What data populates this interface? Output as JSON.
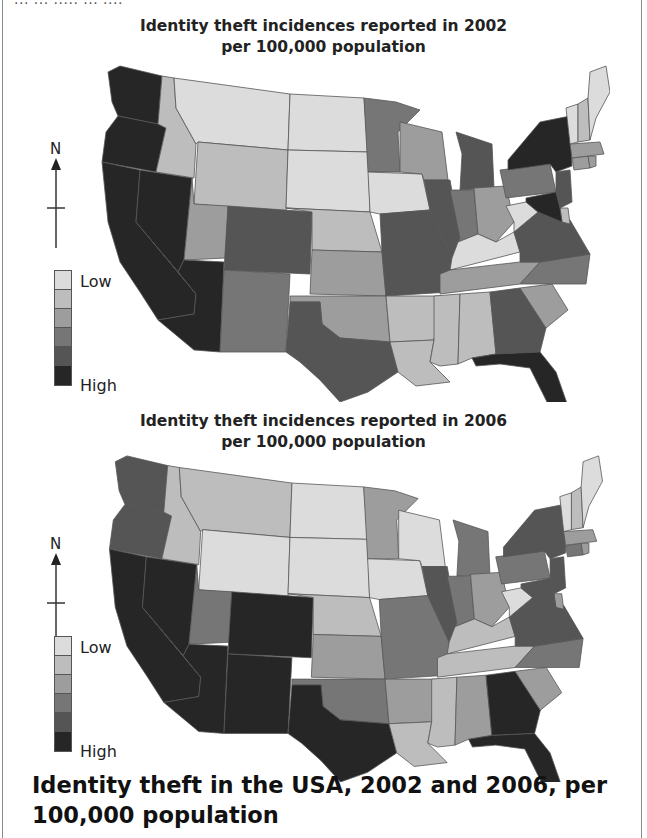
{
  "page": {
    "cut_text": "... ... ..... ... ....",
    "caption": "Identity theft in the USA, 2002 and 2006, per 100,000 population"
  },
  "legend": {
    "low_label": "Low",
    "high_label": "High",
    "shades": [
      "#dcdcdc",
      "#bdbdbd",
      "#9d9d9d",
      "#767676",
      "#555555",
      "#262626"
    ]
  },
  "compass": {
    "label": "N"
  },
  "chart_data": [
    {
      "type": "choropleth",
      "title": "Identity theft incidences reported in 2002",
      "subtitle": "per 100,000 population",
      "scale": [
        "Low",
        "",
        "",
        "",
        "",
        "High"
      ],
      "levels_0_low_5_high": {
        "WA": 5,
        "OR": 5,
        "CA": 5,
        "NV": 5,
        "AZ": 5,
        "ID": 1,
        "MT": 0,
        "WY": 1,
        "UT": 2,
        "CO": 4,
        "NM": 3,
        "ND": 0,
        "SD": 0,
        "NE": 1,
        "KS": 2,
        "OK": 2,
        "TX": 4,
        "MN": 3,
        "IA": 0,
        "MO": 4,
        "AR": 1,
        "LA": 1,
        "WI": 2,
        "IL": 4,
        "MI": 4,
        "IN": 3,
        "OH": 2,
        "KY": 0,
        "TN": 2,
        "MS": 1,
        "AL": 1,
        "GA": 4,
        "FL": 5,
        "SC": 2,
        "NC": 3,
        "VA": 4,
        "WV": 0,
        "PA": 3,
        "NY": 5,
        "NJ": 4,
        "DE": 1,
        "MD": 5,
        "CT": 2,
        "RI": 2,
        "MA": 2,
        "VT": 0,
        "NH": 1,
        "ME": 0
      }
    },
    {
      "type": "choropleth",
      "title": "Identity theft incidences reported in 2006",
      "subtitle": "per 100,000 population",
      "scale": [
        "Low",
        "",
        "",
        "",
        "",
        "High"
      ],
      "levels_0_low_5_high": {
        "WA": 4,
        "OR": 4,
        "CA": 5,
        "NV": 5,
        "AZ": 5,
        "ID": 1,
        "MT": 1,
        "WY": 0,
        "UT": 3,
        "CO": 5,
        "NM": 5,
        "ND": 0,
        "SD": 0,
        "NE": 1,
        "KS": 2,
        "OK": 3,
        "TX": 5,
        "MN": 2,
        "IA": 0,
        "MO": 3,
        "AR": 2,
        "LA": 1,
        "WI": 0,
        "IL": 4,
        "MI": 3,
        "IN": 3,
        "OH": 2,
        "KY": 1,
        "TN": 1,
        "MS": 1,
        "AL": 2,
        "GA": 5,
        "FL": 5,
        "SC": 2,
        "NC": 3,
        "VA": 4,
        "WV": 0,
        "PA": 3,
        "NY": 4,
        "NJ": 4,
        "DE": 2,
        "MD": 4,
        "CT": 3,
        "RI": 2,
        "MA": 2,
        "VT": 0,
        "NH": 1,
        "ME": 0
      }
    }
  ]
}
